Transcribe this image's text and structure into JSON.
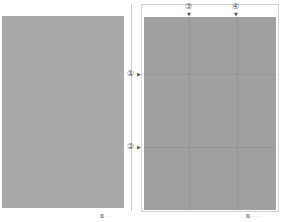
{
  "figures": [
    {
      "caption": "图 · · ·"
    },
    {
      "caption": "图 · · · ·",
      "markers": {
        "m1": "①",
        "m2": "②",
        "m3": "③",
        "m4": "④",
        "arrow_down": "▼",
        "arrow_right": "▶"
      }
    }
  ]
}
